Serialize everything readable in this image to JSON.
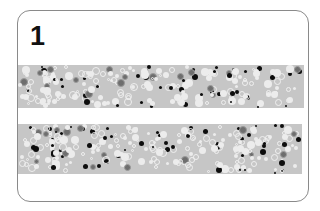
{
  "card": {
    "number": "1"
  },
  "strips": [
    {
      "name": "strip-top",
      "left": 0,
      "top": 54,
      "width": 286,
      "height": 43
    },
    {
      "name": "strip-bottom",
      "left": 0,
      "top": 113,
      "width": 284,
      "height": 50
    }
  ],
  "colors": {
    "strip_bg": "#c6c6c6",
    "dot_black": "#0d0d0d",
    "dot_dark": "#6e6e6e",
    "dot_white": "#ececec"
  }
}
